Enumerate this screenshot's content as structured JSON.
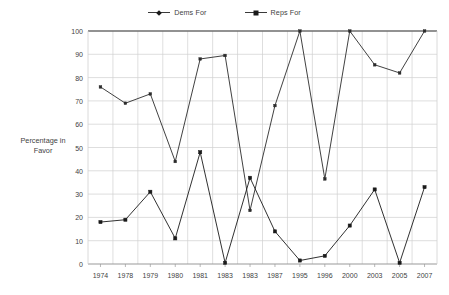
{
  "chart_data": {
    "type": "line",
    "title": "",
    "xlabel": "",
    "ylabel": "Percentage in Favor",
    "ylim": [
      0,
      100
    ],
    "ytick_step": 10,
    "yticks": [
      0,
      10,
      20,
      30,
      40,
      50,
      60,
      70,
      80,
      90,
      100
    ],
    "grid": true,
    "legend_position": "top-center",
    "categories": [
      "1974",
      "1978",
      "1979",
      "1980",
      "1981",
      "1983",
      "1983",
      "1987",
      "1995",
      "1996",
      "2000",
      "2003",
      "2005",
      "2007"
    ],
    "series": [
      {
        "name": "Dems For",
        "marker": "cross",
        "color": "#2b2b2b",
        "values": [
          76,
          69,
          73,
          44,
          88,
          89.5,
          23,
          68,
          100,
          36.5,
          100,
          85.5,
          82,
          100
        ]
      },
      {
        "name": "Reps For",
        "marker": "square",
        "color": "#1a1a1a",
        "values": [
          18,
          19,
          31,
          11,
          48,
          0.5,
          37,
          14,
          1.5,
          3.5,
          16.5,
          32,
          0.5,
          33
        ]
      }
    ]
  },
  "legend": {
    "items": [
      {
        "label": "Dems For",
        "marker": "cross"
      },
      {
        "label": "Reps For",
        "marker": "square"
      }
    ]
  },
  "axis": {
    "y_title_line1": "Percentage in",
    "y_title_line2": "Favor"
  },
  "colors": {
    "line": "#2b2b2b",
    "grid": "#d0d0d0",
    "axis": "#9a9a9a",
    "text": "#3f3f3f",
    "background": "#ffffff"
  }
}
